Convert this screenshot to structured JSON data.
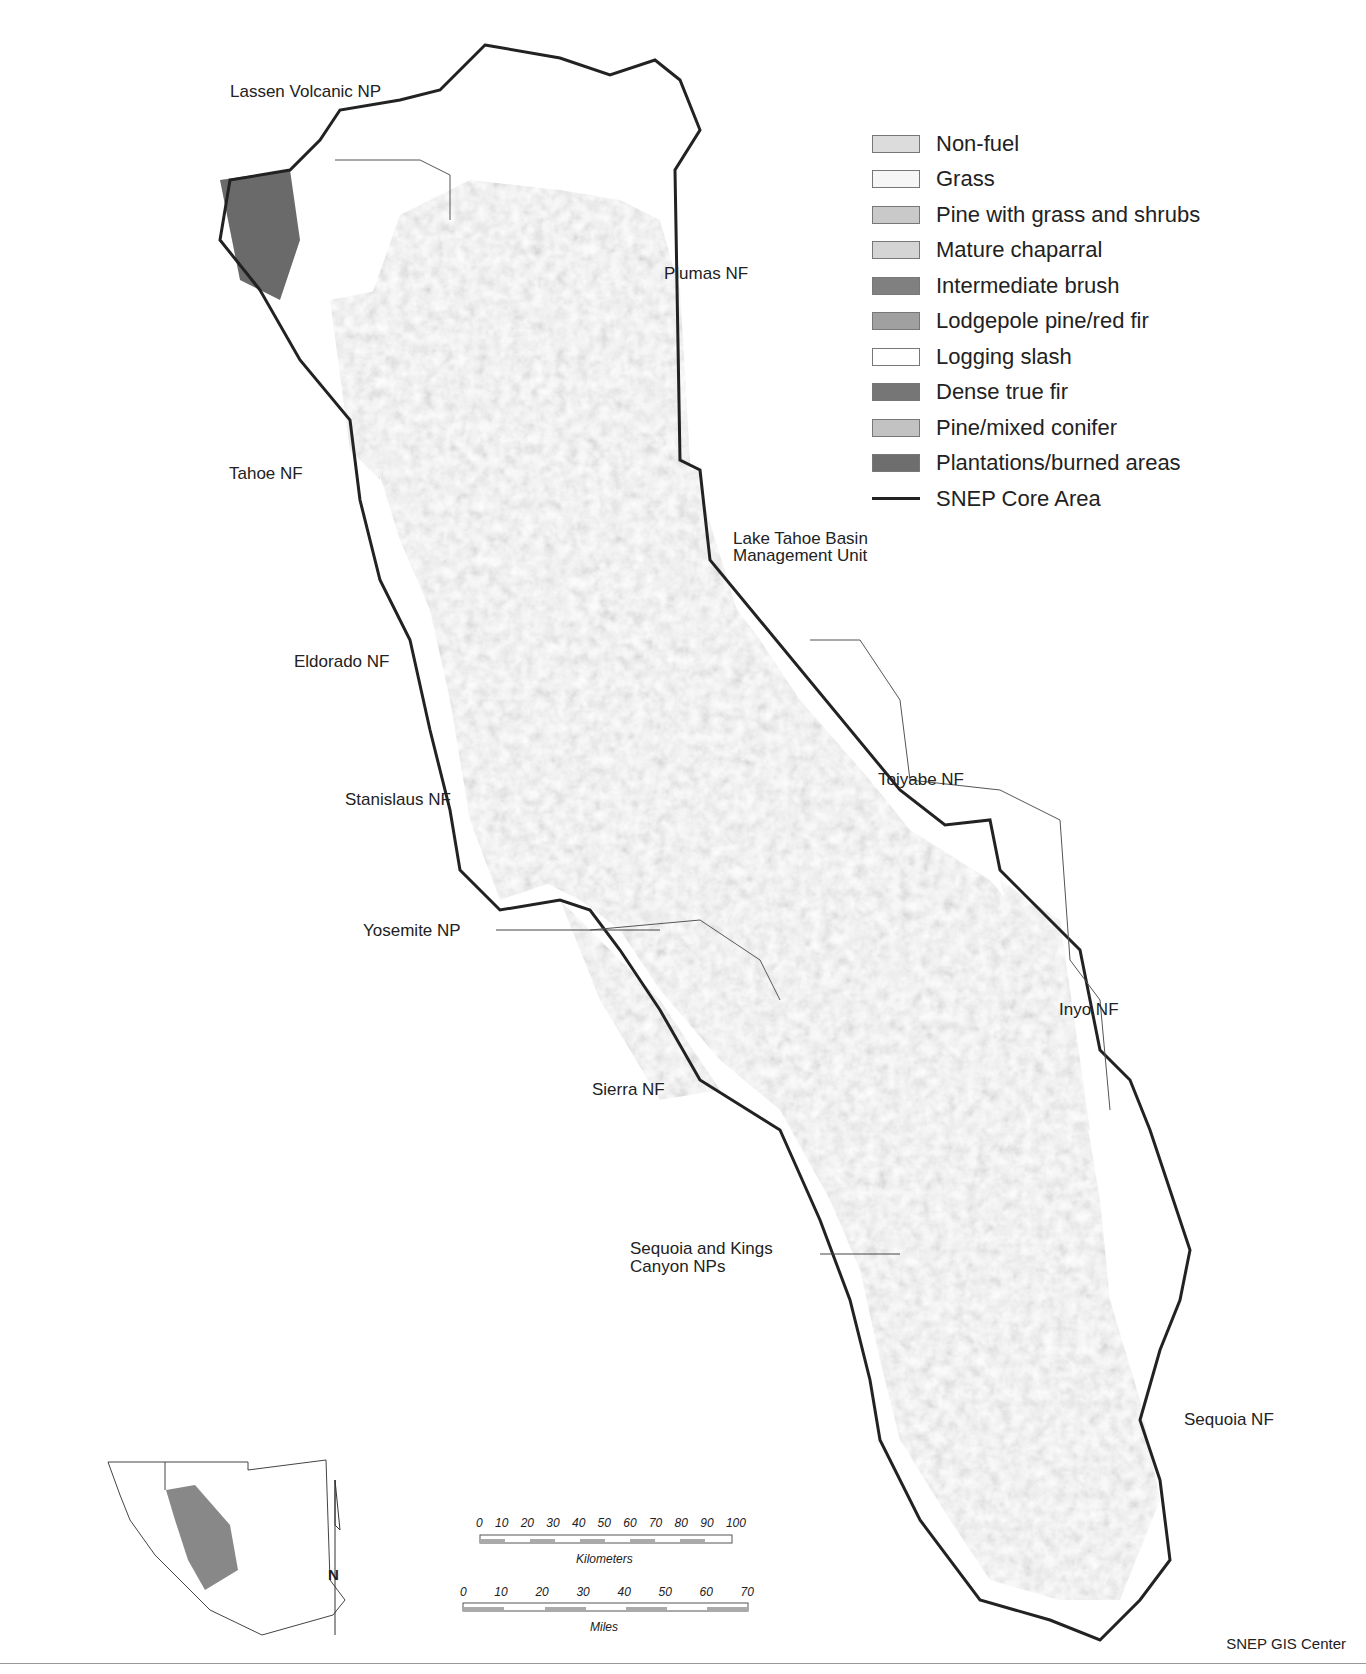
{
  "legend": {
    "items": [
      {
        "label": "Non-fuel",
        "color": "#dcdcdc"
      },
      {
        "label": "Grass",
        "color": "#f6f6f6"
      },
      {
        "label": "Pine with grass and shrubs",
        "color": "#c9c9c9"
      },
      {
        "label": "Mature chaparral",
        "color": "#d4d4d4"
      },
      {
        "label": "Intermediate brush",
        "color": "#808080"
      },
      {
        "label": "Lodgepole pine/red fir",
        "color": "#a0a0a0"
      },
      {
        "label": "Logging slash",
        "color": "#ffffff"
      },
      {
        "label": "Dense true fir",
        "color": "#767676"
      },
      {
        "label": "Pine/mixed conifer",
        "color": "#c2c2c2"
      },
      {
        "label": "Plantations/burned areas",
        "color": "#6e6e6e"
      }
    ],
    "boundary": {
      "label": "SNEP Core Area",
      "color": "#222222"
    }
  },
  "labels": {
    "lassen": "Lassen Volcanic NP",
    "plumas": "Plumas NF",
    "tahoe": "Tahoe NF",
    "ltbmu_1": "Lake Tahoe Basin",
    "ltbmu_2": "Management Unit",
    "eldorado": "Eldorado NF",
    "stanislaus": "Stanislaus NF",
    "toiyabe": "Toiyabe NF",
    "yosemite": "Yosemite NP",
    "inyo": "Inyo NF",
    "sierra": "Sierra NF",
    "skc_1": "Sequoia and Kings",
    "skc_2": "Canyon NPs",
    "sequoia": "Sequoia NF"
  },
  "north_arrow": {
    "label": "N"
  },
  "scale": {
    "km_ticks": [
      "0",
      "10",
      "20",
      "30",
      "40",
      "50",
      "60",
      "70",
      "80",
      "90",
      "100"
    ],
    "km_label": "Kilometers",
    "mi_ticks": [
      "0",
      "10",
      "20",
      "30",
      "40",
      "50",
      "60",
      "70"
    ],
    "mi_label": "Miles"
  },
  "credit": "SNEP GIS Center"
}
